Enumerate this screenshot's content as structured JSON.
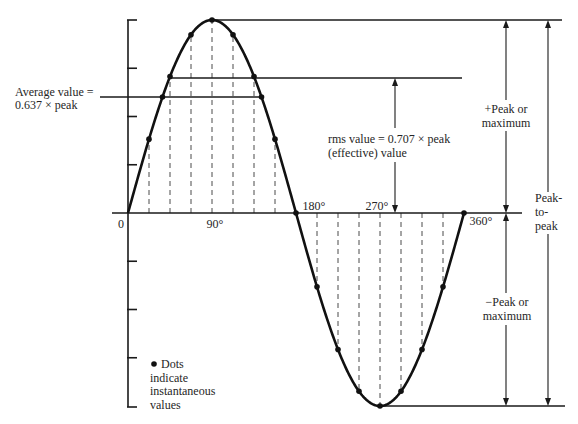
{
  "figure": {
    "average_label": {
      "line1": "Average value =",
      "line2": "0.637 × peak"
    },
    "rms_label": {
      "line1": "rms value = 0.707 × peak",
      "line2": "(effective) value"
    },
    "pos_peak_label": {
      "line1": "+Peak or",
      "line2": "maximum"
    },
    "neg_peak_label": {
      "line1": "−Peak or",
      "line2": "maximum"
    },
    "p2p_label": {
      "line1": "Peak-",
      "line2": "to-",
      "line3": "peak"
    },
    "legend": {
      "line1": "Dots",
      "line2": "indicate",
      "line3": "instantaneous",
      "line4": "values"
    },
    "x_ticks": {
      "t0": "0",
      "t90": "90°",
      "t180": "180°",
      "t270": "270°",
      "t360": "360°"
    }
  },
  "wave": {
    "type": "sine",
    "period_deg": 360,
    "average_factor": 0.637,
    "rms_factor": 0.707,
    "dot_angles_deg": [
      22.5,
      45,
      67.5,
      90,
      112.5,
      135,
      157.5,
      180,
      202.5,
      225,
      247.5,
      270,
      292.5,
      315,
      337.5,
      360
    ],
    "dashed_angles_deg": [
      22.5,
      45,
      67.5,
      90,
      112.5,
      135,
      157.5,
      202.5,
      225,
      247.5,
      270,
      292.5,
      315,
      337.5
    ],
    "y_ticks_above_zero": 4,
    "y_ticks_below_zero": 4
  }
}
